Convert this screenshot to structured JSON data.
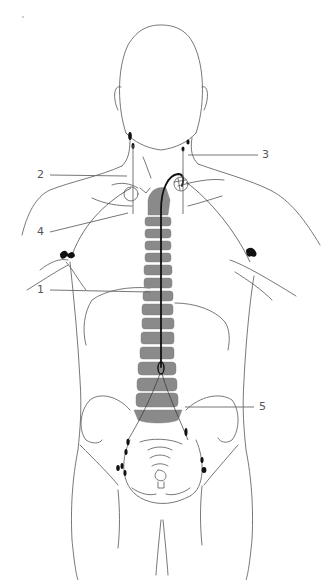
{
  "diagram": {
    "type": "anatomical-illustration",
    "colors": {
      "outline": "#555555",
      "spine": "#8a8a8a",
      "duct": "#111111",
      "lymph_nodes": "#111111",
      "labels": "#555555"
    },
    "callouts": [
      {
        "id": "1",
        "text": "1",
        "points_to": "thoracic duct along spine"
      },
      {
        "id": "2",
        "text": "2",
        "points_to": "right subclavian / jugular region"
      },
      {
        "id": "3",
        "text": "3",
        "points_to": "left cervical lymph node"
      },
      {
        "id": "4",
        "text": "4",
        "points_to": "right lymphatic duct junction"
      },
      {
        "id": "5",
        "text": "5",
        "points_to": "cisterna chyli / lumbar region"
      }
    ]
  }
}
